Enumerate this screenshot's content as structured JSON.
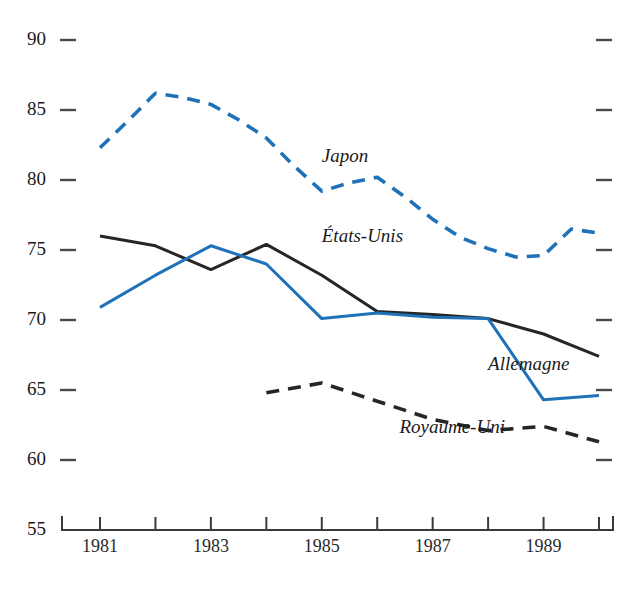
{
  "chart_data": {
    "type": "line",
    "title": "",
    "subtitle": "",
    "xlabel": "",
    "ylabel": "",
    "x": [
      1981,
      1982,
      1983,
      1984,
      1985,
      1986,
      1987,
      1988,
      1989,
      1990
    ],
    "xlim": [
      1980.7,
      1990.3
    ],
    "ylim": [
      55,
      90
    ],
    "yticks": [
      55,
      60,
      65,
      70,
      75,
      80,
      85,
      90
    ],
    "ytick_labels": [
      "55",
      "60",
      "65",
      "70",
      "75",
      "80",
      "85",
      "90"
    ],
    "xticks": [
      1981,
      1982,
      1983,
      1984,
      1985,
      1986,
      1987,
      1988,
      1989,
      1990
    ],
    "xtick_labels": [
      "1981",
      "",
      "1983",
      "",
      "1985",
      "",
      "1987",
      "",
      "1989",
      ""
    ],
    "xtick_labels_shown": [
      "1981",
      "1983",
      "1985",
      "1987",
      "1989"
    ],
    "grid": false,
    "legend": "inline-annotations",
    "legend_position": "inline",
    "series": [
      {
        "name": "Japon",
        "style": "dashed",
        "color": "#1f72b8",
        "x": [
          1981,
          1981.5,
          1982,
          1982.5,
          1983,
          1983.5,
          1984,
          1984.5,
          1985,
          1985.5,
          1986,
          1986.5,
          1987,
          1987.5,
          1988,
          1988.5,
          1989,
          1989.5,
          1990
        ],
        "values": [
          82.3,
          84.2,
          86.2,
          85.9,
          85.4,
          84.3,
          83.0,
          81.0,
          79.2,
          79.8,
          80.2,
          78.8,
          77.2,
          75.9,
          75.1,
          74.5,
          74.6,
          76.5,
          76.2
        ],
        "label_text": "Japon",
        "label_x": 1985.0,
        "label_y": 81.3
      },
      {
        "name": "États-Unis",
        "style": "solid",
        "color": "#262626",
        "x": [
          1981,
          1982,
          1983,
          1984,
          1985,
          1986,
          1987,
          1988,
          1989,
          1990
        ],
        "values": [
          76.0,
          75.3,
          73.6,
          75.4,
          73.2,
          70.6,
          70.4,
          70.1,
          69.0,
          67.4
        ],
        "label_text": "États-Unis",
        "label_x": 1985.0,
        "label_y": 75.6
      },
      {
        "name": "Allemagne",
        "style": "solid",
        "color": "#1f72b8",
        "x": [
          1981,
          1982,
          1983,
          1984,
          1985,
          1986,
          1987,
          1988,
          1989,
          1990
        ],
        "values": [
          70.9,
          73.2,
          75.3,
          74.0,
          70.1,
          70.5,
          70.2,
          70.1,
          64.3,
          64.6
        ],
        "label_text": "Allemagne",
        "label_x": 1988.0,
        "label_y": 66.4
      },
      {
        "name": "Royaume-Uni",
        "style": "dashed",
        "color": "#262626",
        "x": [
          1984,
          1985,
          1986,
          1987,
          1988,
          1989,
          1990
        ],
        "values": [
          64.8,
          65.5,
          64.2,
          62.9,
          62.1,
          62.4,
          61.3
        ],
        "label_text": "Royaume-Uni",
        "label_x": 1986.4,
        "label_y": 61.9
      }
    ]
  },
  "colors": {
    "blue": "#1f72b8",
    "black": "#262626",
    "axis": "#3a3a3a",
    "background": "#ffffff"
  }
}
